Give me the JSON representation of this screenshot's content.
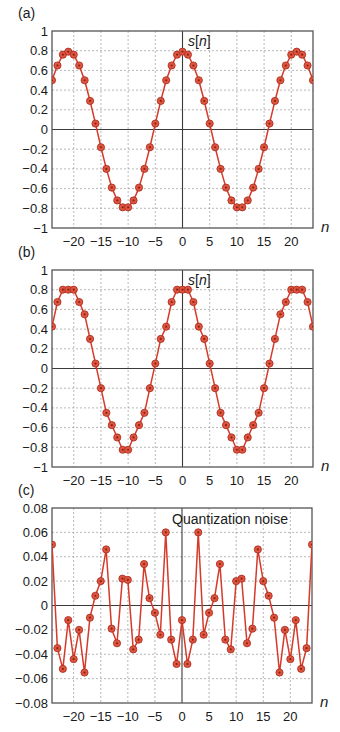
{
  "chart_data": [
    {
      "panel_label": "(a)",
      "type": "line",
      "title": "s[n]",
      "xlabel": "n",
      "ylabel": "",
      "xlim": [
        -24,
        24
      ],
      "ylim": [
        -1,
        1
      ],
      "grid": true,
      "xticks": [
        -20,
        -15,
        -10,
        -5,
        0,
        5,
        10,
        15,
        20
      ],
      "yticks": [
        1,
        0.8,
        0.6,
        0.4,
        0.2,
        0,
        -0.2,
        -0.4,
        -0.6,
        -0.8,
        -1
      ],
      "ytick_labels": [
        "1",
        "0.8",
        "0.6",
        "0.4",
        "0.2",
        "0",
        "−0.2",
        "−0.4",
        "−0.6",
        "−0.8",
        "−1"
      ],
      "xtick_labels": [
        "−20",
        "−15",
        "−10",
        "−5",
        "0",
        "5",
        "10",
        "15",
        "20"
      ],
      "x": [
        -24,
        -23,
        -22,
        -21,
        -20,
        -19,
        -18,
        -17,
        -16,
        -15,
        -14,
        -13,
        -12,
        -11,
        -10,
        -9,
        -8,
        -7,
        -6,
        -5,
        -4,
        -3,
        -2,
        -1,
        0,
        1,
        2,
        3,
        4,
        5,
        6,
        7,
        8,
        9,
        10,
        11,
        12,
        13,
        14,
        15,
        16,
        17,
        18,
        19,
        20,
        21,
        22,
        23,
        24
      ],
      "values": [
        0.5,
        0.65,
        0.76,
        0.79,
        0.76,
        0.65,
        0.5,
        0.29,
        0.06,
        -0.18,
        -0.4,
        -0.59,
        -0.72,
        -0.79,
        -0.79,
        -0.72,
        -0.59,
        -0.4,
        -0.18,
        0.06,
        0.29,
        0.5,
        0.65,
        0.76,
        0.79,
        0.76,
        0.65,
        0.5,
        0.29,
        0.06,
        -0.18,
        -0.4,
        -0.59,
        -0.72,
        -0.79,
        -0.79,
        -0.72,
        -0.59,
        -0.4,
        -0.18,
        0.06,
        0.29,
        0.5,
        0.65,
        0.76,
        0.79,
        0.76,
        0.65,
        0.5
      ]
    },
    {
      "panel_label": "(b)",
      "type": "line",
      "title": "s[n]",
      "xlabel": "n",
      "ylabel": "",
      "xlim": [
        -24,
        24
      ],
      "ylim": [
        -1,
        1
      ],
      "grid": true,
      "xticks": [
        -20,
        -15,
        -10,
        -5,
        0,
        5,
        10,
        15,
        20
      ],
      "yticks": [
        1,
        0.8,
        0.6,
        0.4,
        0.2,
        0,
        -0.2,
        -0.4,
        -0.6,
        -0.8,
        -1
      ],
      "ytick_labels": [
        "1",
        "0.8",
        "0.6",
        "0.4",
        "0.2",
        "0",
        "−0.2",
        "−0.4",
        "−0.6",
        "−0.8",
        "−1"
      ],
      "xtick_labels": [
        "−20",
        "−15",
        "−10",
        "−5",
        "0",
        "5",
        "10",
        "15",
        "20"
      ],
      "x": [
        -24,
        -23,
        -22,
        -21,
        -20,
        -19,
        -18,
        -17,
        -16,
        -15,
        -14,
        -13,
        -12,
        -11,
        -10,
        -9,
        -8,
        -7,
        -6,
        -5,
        -4,
        -3,
        -2,
        -1,
        0,
        1,
        2,
        3,
        4,
        5,
        6,
        7,
        8,
        9,
        10,
        11,
        12,
        13,
        14,
        15,
        16,
        17,
        18,
        19,
        20,
        21,
        22,
        23,
        24
      ],
      "values": [
        0.425,
        0.675,
        0.8,
        0.8,
        0.8,
        0.675,
        0.55,
        0.3,
        0.05,
        -0.2,
        -0.45,
        -0.575,
        -0.7,
        -0.825,
        -0.825,
        -0.7,
        -0.575,
        -0.45,
        -0.2,
        0.05,
        0.3,
        0.425,
        0.675,
        0.8,
        0.8,
        0.8,
        0.675,
        0.425,
        0.3,
        0.05,
        -0.2,
        -0.45,
        -0.575,
        -0.7,
        -0.825,
        -0.825,
        -0.7,
        -0.575,
        -0.45,
        -0.2,
        0.05,
        0.3,
        0.55,
        0.675,
        0.8,
        0.8,
        0.8,
        0.675,
        0.425
      ]
    },
    {
      "panel_label": "(c)",
      "type": "line",
      "title": "Quantization noise",
      "xlabel": "n",
      "ylabel": "",
      "xlim": [
        -24,
        24
      ],
      "ylim": [
        -0.08,
        0.08
      ],
      "grid": true,
      "xticks": [
        -20,
        -15,
        -10,
        -5,
        0,
        5,
        10,
        15,
        20
      ],
      "yticks": [
        0.08,
        0.06,
        0.04,
        0.02,
        0,
        -0.02,
        -0.04,
        -0.06,
        -0.08
      ],
      "ytick_labels": [
        "0.08",
        "0.06",
        "0.04",
        "0.02",
        "0",
        "−0.02",
        "−0.04",
        "−0.06",
        "−0.08"
      ],
      "xtick_labels": [
        "−20",
        "−15",
        "−10",
        "−5",
        "0",
        "5",
        "10",
        "15",
        "20"
      ],
      "x": [
        -24,
        -23,
        -22,
        -21,
        -20,
        -19,
        -18,
        -17,
        -16,
        -15,
        -14,
        -13,
        -12,
        -11,
        -10,
        -9,
        -8,
        -7,
        -6,
        -5,
        -4,
        -3,
        -2,
        -1,
        0,
        1,
        2,
        3,
        4,
        5,
        6,
        7,
        8,
        9,
        10,
        11,
        12,
        13,
        14,
        15,
        16,
        17,
        18,
        19,
        20,
        21,
        22,
        23,
        24
      ],
      "values": [
        0.05,
        -0.035,
        -0.052,
        -0.012,
        -0.044,
        -0.02,
        -0.055,
        -0.01,
        0.008,
        0.02,
        0.046,
        -0.019,
        -0.031,
        0.022,
        0.021,
        -0.036,
        -0.028,
        0.034,
        0.006,
        -0.006,
        -0.024,
        0.06,
        -0.028,
        -0.048,
        -0.012,
        -0.048,
        -0.028,
        0.06,
        -0.024,
        -0.006,
        0.006,
        0.034,
        -0.028,
        -0.036,
        0.02,
        0.022,
        -0.031,
        -0.019,
        0.046,
        0.02,
        0.008,
        -0.01,
        -0.055,
        -0.02,
        -0.044,
        -0.012,
        -0.052,
        -0.035,
        0.05
      ]
    }
  ],
  "colors": {
    "line": "#d63a2a",
    "marker_fill": "#e0553f",
    "marker_stroke": "#a52a1c",
    "grid": "#9a9a9a",
    "axis": "#3a3a3a",
    "frame": "#555555"
  },
  "panels": {
    "a": {
      "label": "(a)",
      "title": "s[n]",
      "xlabel": "n"
    },
    "b": {
      "label": "(b)",
      "title": "s[n]",
      "xlabel": "n"
    },
    "c": {
      "label": "(c)",
      "title": "Quantization noise",
      "xlabel": "n"
    }
  }
}
